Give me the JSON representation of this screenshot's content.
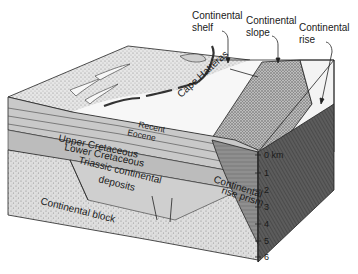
{
  "figure": {
    "callouts": [
      {
        "id": "shelf",
        "line1": "Continental",
        "line2": "shelf"
      },
      {
        "id": "slope",
        "line1": "Continental",
        "line2": "slope"
      },
      {
        "id": "rise",
        "line1": "Continental",
        "line2": "rise"
      }
    ],
    "place_label": "Cape Hatteras",
    "layers": {
      "recent": "Recent",
      "eocene": "Eocene",
      "upper_cretaceous": "Upper Cretaceous",
      "lower_cretaceous": "Lower Cretaceous",
      "triassic_line1": "Triassic continental",
      "triassic_line2": "deposits",
      "continental_block": "Continental block",
      "rise_prism_line1": "Continental",
      "rise_prism_line2": "rise prism"
    },
    "depth_scale": {
      "unit": "km",
      "ticks": [
        "0 km",
        "1",
        "2",
        "3",
        "4",
        "5",
        "6"
      ]
    },
    "colors": {
      "surface_light": "#f4f4f4",
      "shelf_stipple": "#cfcfcf",
      "slope_dark": "#9a9a9a",
      "sediment_band": "#c4c4c4",
      "block": "#dcdcdc",
      "prism": "#8a8a8a",
      "right_face": "#5a5a5a",
      "ink": "#1a1a1a"
    }
  }
}
